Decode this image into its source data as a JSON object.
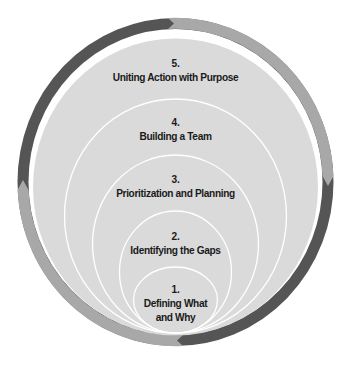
{
  "diagram": {
    "type": "nested-circles-with-cycle-ring",
    "colors": {
      "ring_dark": "#555555",
      "ring_light": "#a8a8a8",
      "disc_fill": "#dadada",
      "circle_stroke": "#ffffff",
      "text": "#1a1a1a",
      "background": "#ffffff"
    },
    "ring_segments": [
      {
        "position": "top-left",
        "shade": "dark",
        "arrow": "points-clockwise"
      },
      {
        "position": "top-right",
        "shade": "light",
        "arrow": "points-clockwise"
      },
      {
        "position": "bottom-right",
        "shade": "dark",
        "arrow": "points-clockwise"
      },
      {
        "position": "bottom-left",
        "shade": "light",
        "arrow": "points-clockwise"
      }
    ],
    "levels": [
      {
        "number": "1.",
        "title_line1": "Defining What",
        "title_line2": "and Why"
      },
      {
        "number": "2.",
        "title": "Identifying the Gaps"
      },
      {
        "number": "3.",
        "title": "Prioritization and Planning"
      },
      {
        "number": "4.",
        "title": "Building a Team"
      },
      {
        "number": "5.",
        "title": "Uniting Action with Purpose"
      }
    ]
  }
}
